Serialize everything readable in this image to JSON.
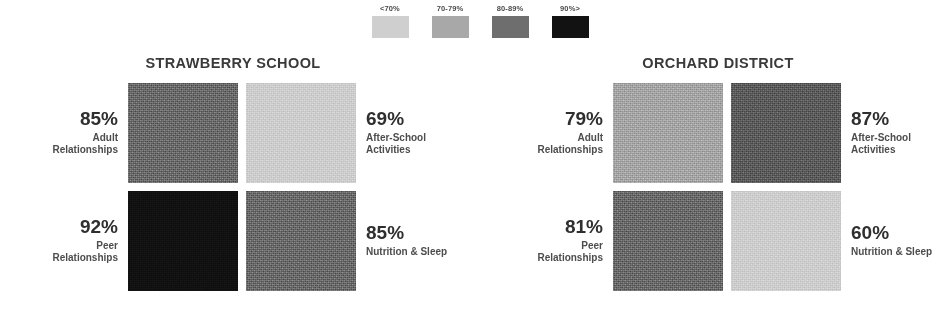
{
  "legend": {
    "items": [
      {
        "label": "<70%",
        "color": "#cfcfcf"
      },
      {
        "label": "70-79%",
        "color": "#a8a8a8"
      },
      {
        "label": "80-89%",
        "color": "#6e6e6e"
      },
      {
        "label": "90%>",
        "color": "#121212"
      }
    ]
  },
  "panels": [
    {
      "title": "STRAWBERRY SCHOOL",
      "left": [
        {
          "value": "85%",
          "name": "Adult\nRelationships"
        },
        {
          "value": "92%",
          "name": "Peer\nRelationships"
        }
      ],
      "right": [
        {
          "value": "69%",
          "name": "After-School\nActivities"
        },
        {
          "value": "85%",
          "name": "Nutrition & Sleep"
        }
      ],
      "tiles": [
        {
          "value": 85,
          "band": "80-89%",
          "color": "#6e6e6e"
        },
        {
          "value": 69,
          "band": "<70%",
          "color": "#cfcfcf"
        },
        {
          "value": 92,
          "band": "90%>",
          "color": "#121212"
        },
        {
          "value": 85,
          "band": "80-89%",
          "color": "#6e6e6e"
        }
      ]
    },
    {
      "title": "ORCHARD DISTRICT",
      "left": [
        {
          "value": "79%",
          "name": "Adult\nRelationships"
        },
        {
          "value": "81%",
          "name": "Peer\nRelationships"
        }
      ],
      "right": [
        {
          "value": "87%",
          "name": "After-School\nActivities"
        },
        {
          "value": "60%",
          "name": "Nutrition & Sleep"
        }
      ],
      "tiles": [
        {
          "value": 79,
          "band": "70-79%",
          "color": "#a8a8a8"
        },
        {
          "value": 87,
          "band": "80-89%",
          "color": "#5f5f5f"
        },
        {
          "value": 81,
          "band": "80-89%",
          "color": "#6e6e6e"
        },
        {
          "value": 60,
          "band": "<70%",
          "color": "#cfcfcf"
        }
      ]
    }
  ],
  "chart_data": {
    "type": "heatmap",
    "title": "",
    "xlabel": "",
    "ylabel": "",
    "grid": false,
    "legend_position": "top-center",
    "legend_entries": [
      "<70%",
      "70-79%",
      "80-89%",
      "90%>"
    ],
    "legend_colors": [
      "#cfcfcf",
      "#a8a8a8",
      "#6e6e6e",
      "#121212"
    ],
    "groups": [
      "STRAWBERRY SCHOOL",
      "ORCHARD DISTRICT"
    ],
    "categories": [
      "Adult Relationships",
      "After-School Activities",
      "Peer Relationships",
      "Nutrition & Sleep"
    ],
    "series": [
      {
        "name": "STRAWBERRY SCHOOL",
        "values": [
          85,
          69,
          92,
          85
        ]
      },
      {
        "name": "ORCHARD DISTRICT",
        "values": [
          79,
          87,
          81,
          60
        ]
      }
    ],
    "value_unit": "%",
    "cell_layout": "2x2 per group; row-major: [Adult Relationships, After-School Activities, Peer Relationships, Nutrition & Sleep]"
  }
}
